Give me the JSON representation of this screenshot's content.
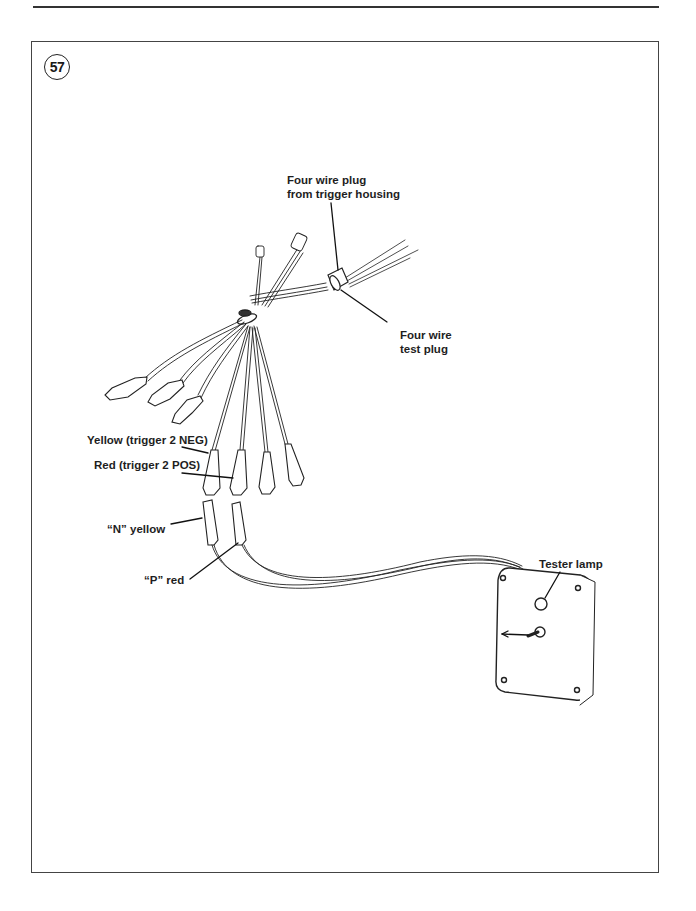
{
  "figure": {
    "number": "57"
  },
  "labels": {
    "four_wire_plug_line1": "Four wire plug",
    "four_wire_plug_line2": "from trigger housing",
    "four_wire_test_line1": "Four wire",
    "four_wire_test_line2": "test plug",
    "yellow_trigger": "Yellow (trigger 2 NEG)",
    "red_trigger": "Red (trigger 2 POS)",
    "n_yellow": "“N” yellow",
    "p_red": "“P” red",
    "tester_lamp": "Tester lamp"
  },
  "tester_box": {
    "switch_label": "RESET",
    "face_text_line1": "TRIGGER POLARITY",
    "face_text_line2": "DETECTOR"
  }
}
